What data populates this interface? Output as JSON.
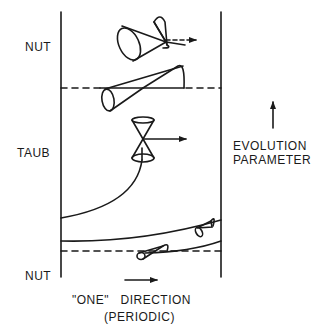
{
  "labels": {
    "top_region": "NUT",
    "middle_region": "TAUB",
    "bottom_region": "NUT",
    "evolution_line1": "EVOLUTION",
    "evolution_line2": "PARAMETER",
    "direction_line1": "\"ONE\"   DIRECTION",
    "direction_line2": "(PERIODIC)"
  },
  "colors": {
    "ink": "#1a1a1a",
    "background": "#ffffff"
  },
  "elements": {
    "boundaries": [
      "left-boundary-line",
      "right-boundary-line"
    ],
    "dashed_horizons": [
      "upper-nut-taub-horizon",
      "lower-taub-nut-horizon"
    ],
    "light_cones": [
      "nut-top-light-cone",
      "horizon-light-cone",
      "taub-light-cone",
      "lower-light-cone-right",
      "lower-light-cone-left"
    ],
    "arrows": [
      "evolution-parameter-arrow",
      "one-direction-arrow",
      "nut-cone-arrow",
      "taub-cone-arrow"
    ]
  }
}
